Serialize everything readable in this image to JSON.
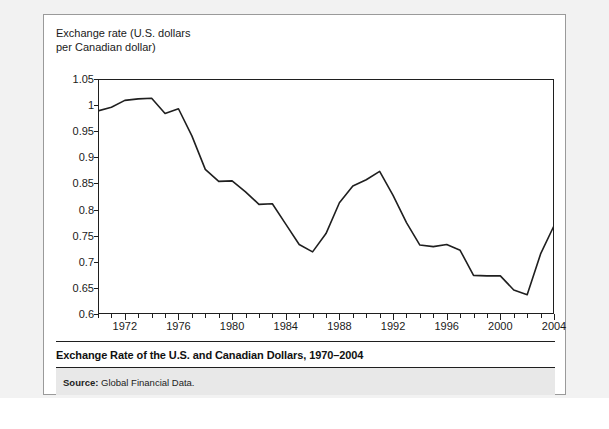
{
  "figure": {
    "axis_title_line1": "Exchange rate (U.S. dollars",
    "axis_title_line2": "per Canadian dollar)",
    "axis_title": "Exchange rate (U.S. dollars\nper Canadian dollar)",
    "caption": "Exchange Rate of the U.S. and Canadian Dollars, 1970–2004",
    "source_label": "Source:",
    "source_value": "Global Financial Data."
  },
  "chart_data": {
    "type": "line",
    "title": "Exchange Rate of the U.S. and Canadian Dollars, 1970–2004",
    "xlabel": "",
    "ylabel": "Exchange rate (U.S. dollars per Canadian dollar)",
    "xlim": [
      1970,
      2004
    ],
    "ylim": [
      0.6,
      1.05
    ],
    "grid": false,
    "legend": "none",
    "line_color": "#1f1f1f",
    "ytick_labels": [
      "1.05",
      "1",
      "0.95",
      "0.9",
      "0.85",
      "0.8",
      "0.75",
      "0.7",
      "0.65",
      "0.6"
    ],
    "ytick_values": [
      1.05,
      1.0,
      0.95,
      0.9,
      0.85,
      0.8,
      0.75,
      0.7,
      0.65,
      0.6
    ],
    "xtick_labels": [
      "1972",
      "1976",
      "1980",
      "1984",
      "1988",
      "1992",
      "1996",
      "2000",
      "2004"
    ],
    "xtick_values": [
      1972,
      1976,
      1980,
      1984,
      1988,
      1992,
      1996,
      2000,
      2004
    ],
    "xminor_step": 1,
    "x": [
      1970,
      1971,
      1972,
      1973,
      1974,
      1975,
      1976,
      1977,
      1978,
      1979,
      1980,
      1981,
      1982,
      1983,
      1984,
      1985,
      1986,
      1987,
      1988,
      1989,
      1990,
      1991,
      1992,
      1993,
      1994,
      1995,
      1996,
      1997,
      1998,
      1999,
      2000,
      2001,
      2002,
      2003,
      2004
    ],
    "values": [
      0.989,
      0.996,
      1.009,
      1.012,
      1.013,
      0.984,
      0.993,
      0.941,
      0.877,
      0.854,
      0.855,
      0.834,
      0.81,
      0.811,
      0.772,
      0.733,
      0.719,
      0.754,
      0.813,
      0.845,
      0.857,
      0.873,
      0.827,
      0.775,
      0.732,
      0.729,
      0.733,
      0.722,
      0.674,
      0.673,
      0.673,
      0.646,
      0.637,
      0.715,
      0.769
    ],
    "series": [
      {
        "name": "U.S. dollars per Canadian dollar",
        "values": [
          0.989,
          0.996,
          1.009,
          1.012,
          1.013,
          0.984,
          0.993,
          0.941,
          0.877,
          0.854,
          0.855,
          0.834,
          0.81,
          0.811,
          0.772,
          0.733,
          0.719,
          0.754,
          0.813,
          0.845,
          0.857,
          0.873,
          0.827,
          0.775,
          0.732,
          0.729,
          0.733,
          0.722,
          0.674,
          0.673,
          0.673,
          0.646,
          0.637,
          0.715,
          0.769
        ]
      }
    ],
    "annotations": []
  }
}
